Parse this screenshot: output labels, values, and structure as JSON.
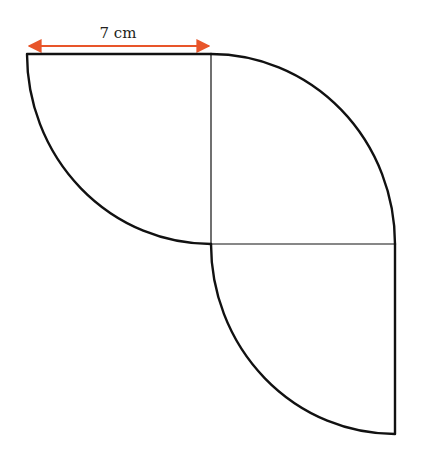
{
  "diagram": {
    "dimension_label": "7 cm",
    "arrow_color": "#e8552a",
    "line_color": "#111111",
    "shapes": [
      "quarter-circle-top-left",
      "quarter-circle-top-right",
      "quarter-circle-bottom-right"
    ]
  }
}
